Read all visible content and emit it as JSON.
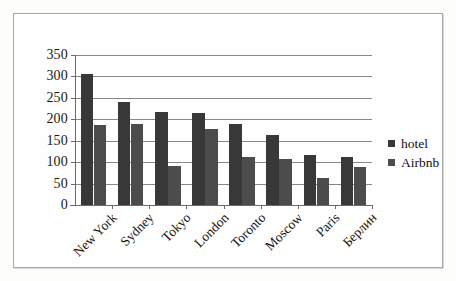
{
  "chart_data": {
    "type": "bar",
    "title": "",
    "xlabel": "",
    "ylabel": "",
    "ylim": [
      0,
      350
    ],
    "yticks": [
      0,
      50,
      100,
      150,
      200,
      250,
      300,
      350
    ],
    "grid": true,
    "legend_position": "right",
    "categories": [
      "New York",
      "Sydney",
      "Tokyo",
      "London",
      "Toronto",
      "Moscow",
      "Paris",
      "Берлин"
    ],
    "series": [
      {
        "name": "hotel",
        "color": "#383838",
        "values": [
          305,
          240,
          218,
          215,
          190,
          164,
          116,
          112
        ]
      },
      {
        "name": "Airbnb",
        "color": "#4c4c4c",
        "values": [
          186,
          190,
          91,
          177,
          111,
          107,
          62,
          89
        ]
      }
    ]
  },
  "legend": {
    "items": [
      {
        "label": "hotel",
        "marker": "square-swatch-dark"
      },
      {
        "label": "Airbnb",
        "marker": "square-swatch-gray"
      }
    ]
  }
}
